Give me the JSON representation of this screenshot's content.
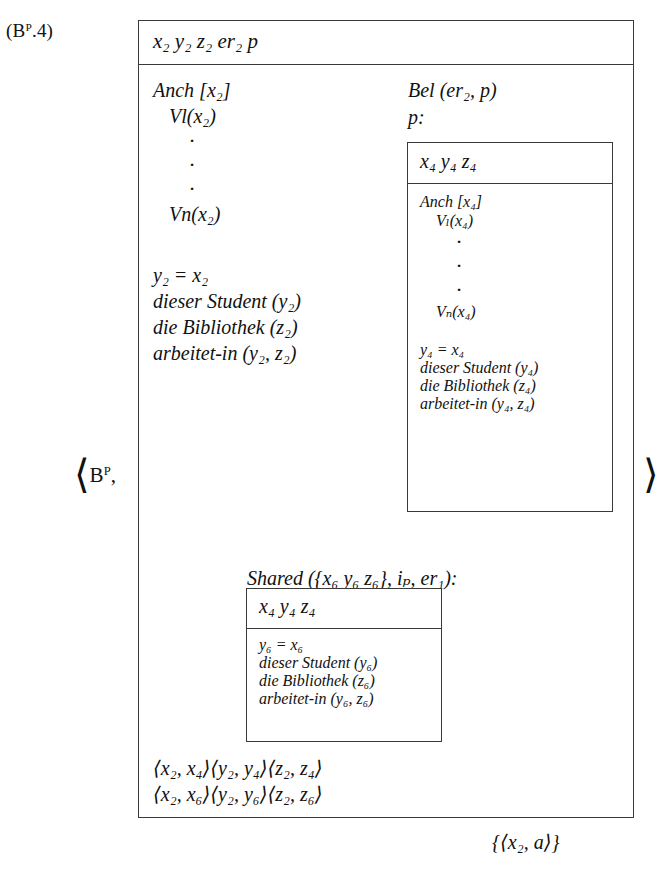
{
  "figure": {
    "equation_label": "(Bᴾ.4)",
    "equation_label_base": "(B",
    "equation_label_sup": "P",
    "equation_label_tail": ".4)",
    "bracket_left": "⟨",
    "bracket_right": "⟩",
    "bracket_left_label_base": "B",
    "bracket_left_label_sup": "P",
    "bracket_left_label_comma": ","
  },
  "outer_drs": {
    "name": "main-drs",
    "universe": "x₂  y₂  z₂  er₂  p",
    "anchor": {
      "header": "Anch [x₂]",
      "first": "Vl(x₂)",
      "dots": [
        "·",
        "·",
        "·"
      ],
      "last": "Vn(x₂)"
    },
    "conditions": [
      "y₂ = x₂",
      "dieser Student (y₂)",
      "die Bibliothek (z₂)",
      "arbeitet-in (y₂, z₂)"
    ],
    "bel_label": "Bel (er₂, p)",
    "p_label": "p:",
    "shared_label": "Shared ({x₆ y₆ z₆}, iₚ, er₁):",
    "links": [
      "⟨x₂, x₄⟩⟨y₂, y₄⟩⟨z₂, z₄⟩",
      "⟨x₂, x₆⟩⟨y₂, y₆⟩⟨z₂, z₆⟩"
    ]
  },
  "bel_drs": {
    "name": "belief-drs",
    "universe": "x₄  y₄  z₄",
    "anchor": {
      "header": "Anch [x₄]",
      "first": "Vₗ(x₄)",
      "dots": [
        "·",
        "·",
        "·"
      ],
      "last": "Vₙ(x₄)"
    },
    "conditions": [
      "y₄ = x₄",
      "dieser Student (y₄)",
      "die Bibliothek (z₄)",
      "arbeitet-in (y₄, z₄)"
    ]
  },
  "shared_drs": {
    "name": "shared-drs",
    "universe": "x₄  y₄  z₄",
    "conditions": [
      "y₆ = x₆",
      "dieser Student (y₆)",
      "die Bibliothek (z₆)",
      "arbeitet-in (y₆, z₆)"
    ]
  },
  "external": {
    "set": "{⟨x₂, a⟩}"
  },
  "colors": {
    "ink": "#111111",
    "rule": "#3a3a3a",
    "paper": "#ffffff"
  }
}
